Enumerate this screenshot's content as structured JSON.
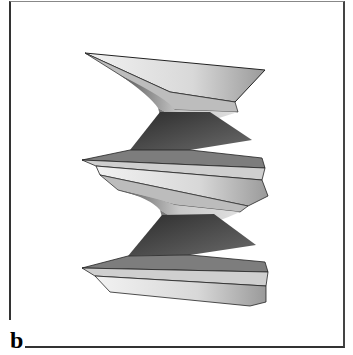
{
  "panel": {
    "label": "b",
    "description": "3D rendered twisted helicoidal surface (two repeating turns)"
  },
  "colors": {
    "frame": "#333333",
    "light": "#e6e6e6",
    "mid": "#a9a9a9",
    "dark": "#4a4a4a",
    "edge": "#222222"
  }
}
